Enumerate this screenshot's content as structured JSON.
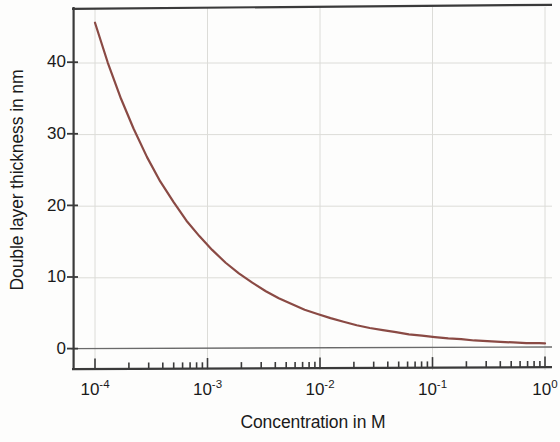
{
  "chart_data": {
    "type": "line",
    "title": "",
    "xlabel": "Concentration in M",
    "ylabel": "Double layer thickness in nm",
    "xscale": "log",
    "yscale": "linear",
    "xlim": [
      0.0001,
      1.0
    ],
    "ylim": [
      -1.5,
      47.5
    ],
    "grid": true,
    "legend": null,
    "line_color": "#8a4a44",
    "axis_color": "#3a3a3a",
    "grid_color": "#d8d8d4",
    "x_ticks": [
      {
        "value": 0.0001,
        "label": "10",
        "exponent": "-4"
      },
      {
        "value": 0.001,
        "label": "10",
        "exponent": "-3"
      },
      {
        "value": 0.01,
        "label": "10",
        "exponent": "-2"
      },
      {
        "value": 0.1,
        "label": "10",
        "exponent": "-1"
      },
      {
        "value": 1,
        "label": "10",
        "exponent": "0"
      }
    ],
    "y_ticks": [
      {
        "value": 0,
        "label": "0"
      },
      {
        "value": 10,
        "label": "10"
      },
      {
        "value": 20,
        "label": "20"
      },
      {
        "value": 30,
        "label": "30"
      },
      {
        "value": 40,
        "label": "40"
      }
    ],
    "series": [
      {
        "name": "Debye double layer thickness",
        "x": [
          0.0001,
          0.00013,
          0.00017,
          0.00022,
          0.00029,
          0.00038,
          0.0005,
          0.00065,
          0.00085,
          0.0011,
          0.00145,
          0.0019,
          0.0025,
          0.0033,
          0.0043,
          0.0056,
          0.0073,
          0.0095,
          0.0124,
          0.0162,
          0.0212,
          0.0277,
          0.0362,
          0.0473,
          0.0617,
          0.0806,
          0.105,
          0.138,
          0.18,
          0.235,
          0.307,
          0.401,
          0.523,
          0.683,
          0.892,
          1.0
        ],
        "y": [
          45.5,
          39.9,
          34.9,
          30.7,
          26.7,
          23.3,
          20.4,
          17.8,
          15.6,
          13.7,
          11.9,
          10.4,
          9.1,
          7.9,
          6.9,
          6.1,
          5.3,
          4.7,
          4.1,
          3.6,
          3.1,
          2.7,
          2.4,
          2.1,
          1.8,
          1.6,
          1.4,
          1.2,
          1.1,
          0.9,
          0.8,
          0.7,
          0.6,
          0.5,
          0.5,
          0.45
        ]
      }
    ]
  }
}
